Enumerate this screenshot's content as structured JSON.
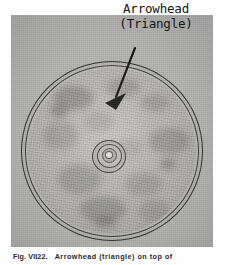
{
  "figure": {
    "annotation": {
      "line_1": "Arrowhead",
      "line_2": "(Triangle)"
    },
    "caption": {
      "number": "Fig.  VII22.",
      "text": "Arrowhead (triangle) on top of"
    },
    "photo": {
      "subject": "circular disc specimen photographed from above",
      "background_color": "#b4b4b3",
      "disc_color": "#b6b5b2",
      "rim_color": "#2c2c2c",
      "marker_color": "#1a1a1a"
    },
    "marker": {
      "name": "arrowhead-triangle",
      "shape": "triangle"
    },
    "blotches": [
      {
        "left": 26,
        "top": 18,
        "w": 40,
        "h": 24,
        "color": "rgba(70,68,64,0.32)"
      },
      {
        "left": 78,
        "top": 10,
        "w": 34,
        "h": 20,
        "color": "rgba(80,78,74,0.26)"
      },
      {
        "left": 112,
        "top": 26,
        "w": 30,
        "h": 18,
        "color": "rgba(75,73,69,0.22)"
      },
      {
        "left": 14,
        "top": 54,
        "w": 36,
        "h": 28,
        "color": "rgba(85,83,79,0.24)"
      },
      {
        "left": 120,
        "top": 60,
        "w": 42,
        "h": 26,
        "color": "rgba(72,70,66,0.26)"
      },
      {
        "left": 56,
        "top": 44,
        "w": 30,
        "h": 20,
        "color": "rgba(92,90,86,0.18)"
      },
      {
        "left": 30,
        "top": 96,
        "w": 44,
        "h": 30,
        "color": "rgba(78,76,72,0.26)"
      },
      {
        "left": 96,
        "top": 104,
        "w": 38,
        "h": 24,
        "color": "rgba(82,80,76,0.22)"
      },
      {
        "left": 52,
        "top": 128,
        "w": 46,
        "h": 26,
        "color": "rgba(70,68,64,0.28)"
      },
      {
        "left": 110,
        "top": 132,
        "w": 32,
        "h": 22,
        "color": "rgba(88,86,82,0.20)"
      },
      {
        "left": 22,
        "top": 36,
        "w": 18,
        "h": 14,
        "color": "rgba(55,53,50,0.30)"
      },
      {
        "left": 132,
        "top": 90,
        "w": 16,
        "h": 12,
        "color": "rgba(55,53,50,0.28)"
      },
      {
        "left": 66,
        "top": 148,
        "w": 22,
        "h": 12,
        "color": "rgba(60,58,55,0.26)"
      },
      {
        "left": 88,
        "top": 72,
        "w": 26,
        "h": 16,
        "color": "rgba(95,93,89,0.16)"
      }
    ]
  }
}
